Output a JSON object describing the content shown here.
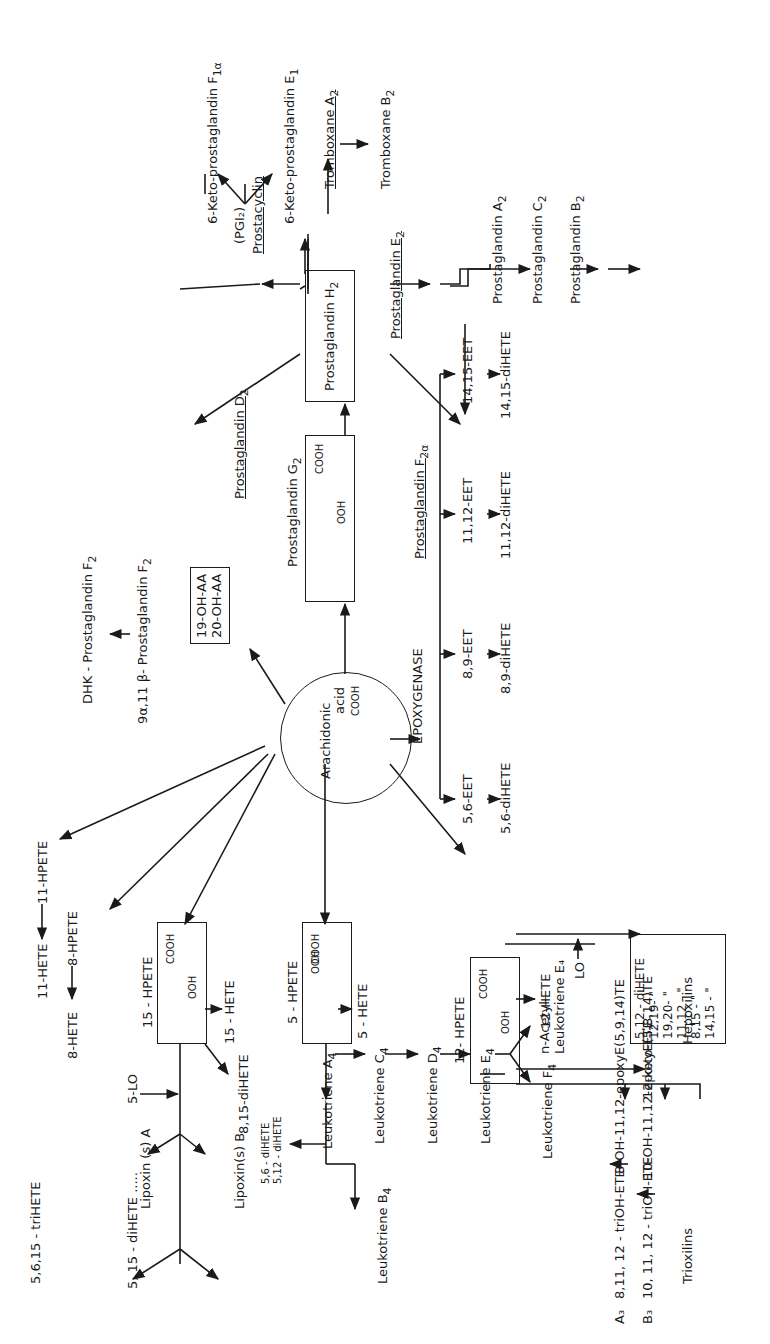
{
  "diagram": {
    "orientation": "rotated -90deg (text reads bottom-to-top)",
    "center": {
      "label_1": "Arachidonic",
      "label_2": "acid",
      "formula": "COOH"
    },
    "cyclooxygenase": {
      "pgg2": {
        "label": "Prostaglandin G",
        "sub": "2",
        "formula_cooh": "COOH",
        "formula_ooh": "OOH"
      },
      "pgh2": {
        "label": "Prostaglandin H",
        "sub": "2"
      },
      "pgd2": {
        "label": "Prostaglandin D",
        "sub": "2"
      },
      "pgf2a": {
        "label": "Prostaglandin F",
        "sub": "2α"
      },
      "pge2": {
        "label": "Prostaglandin E",
        "sub": "2"
      },
      "pgi2": {
        "label": "Prostacyclin",
        "abbr": "(PGI₂)"
      },
      "keto_f1a": {
        "label": "6-Keto-prostaglandin F",
        "sub": "1α"
      },
      "keto_e1": {
        "label": "6-Keto-prostaglandin E",
        "sub": "1"
      },
      "txa2": {
        "label": "Tromboxane A",
        "sub": "2"
      },
      "txb2": {
        "label": "Tromboxane B",
        "sub": "2"
      },
      "pga2": {
        "label": "Prostaglandin  A",
        "sub": "2"
      },
      "pgc2": {
        "label": "Prostaglandin C",
        "sub": "2"
      },
      "pgb2": {
        "label": "Prostaglandin B",
        "sub": "2"
      },
      "dhk_pgf2": {
        "label": "DHK - Prostaglandin  F",
        "sub": "2"
      },
      "pgf2_beta": {
        "label": "9α,11 β- Prostaglandin  F",
        "sub": "2"
      }
    },
    "omega_hydroxylase": {
      "line_1": "19-OH-AA",
      "line_2": "20-OH-AA"
    },
    "epoxygenase": {
      "label": "EPOXYGENASE",
      "eets": [
        "5,6-EET",
        "8,9-EET",
        "11,12-EET",
        "14,15-EET"
      ],
      "dihetes": [
        "5,6-diHETE",
        "8,9-diHETE",
        "11,12-diHETE",
        "14,15-diHETE"
      ]
    },
    "hpete_misc": {
      "hpete_11": "11-HPETE",
      "hete_11": "11-HETE",
      "hpete_8": "8-HPETE",
      "hete_8": "8-HETE"
    },
    "lipoxygenase_15": {
      "hpete": "15 - HPETE",
      "formula_cooh": "COOH",
      "formula_ooh": "OOH",
      "hete": "15 - HETE",
      "dihete": "8,15-diHETE",
      "enzyme": "5-LO",
      "lipoxin_a": "Lipoxin (s) A",
      "lipoxin_b": "Lipoxin(s) B",
      "trihete": "5,6,15 - triHETE",
      "dihete_515": "5, 15 - diHETE ....."
    },
    "lipoxygenase_5": {
      "hpete": "5 - HPETE",
      "formula_cooh": "COOH",
      "formula_ooh": "OOH",
      "hete": "5 - HETE",
      "lta4": {
        "label": "Leukotriene A",
        "sub": "4"
      },
      "ltb4": {
        "label": "Leukotriene B",
        "sub": "4"
      },
      "ltc4": {
        "label": "Leukotriene C",
        "sub": "4"
      },
      "ltd4": {
        "label": "Leukotriene D",
        "sub": "4"
      },
      "lte4": {
        "label": "Leukotriene E",
        "sub": "4"
      },
      "ltf4": {
        "label": "Leukotriene F",
        "sub": "4"
      },
      "acetyl_lte4_1": "n-Acetyl-",
      "acetyl_lte4_2": "Leukotriene E₄",
      "dihete_56": "5,6 - diHETE",
      "dihete_512": "5,12 - diHETE"
    },
    "lipoxygenase_12": {
      "hpete": "12- HPETE",
      "formula_cooh": "COOH",
      "formula_ooh": "OOH",
      "hete": "12-HETE",
      "keto": "12-keto-ETE",
      "enzyme": "LO",
      "dihete_list": [
        "5,12 - diHETE",
        "12,19-    \"",
        "19,20-    \"",
        "11,12 -   \"",
        "8,15 -    \"",
        "14,15 -   \""
      ],
      "hepoxilin_a": "8-OH-11,12-epoxyE(5,9,14)TE",
      "hepoxilin_b": "10-OH-11,12-epoxyE(5,8,14)TE",
      "hepoxilins_label": "Hepoxilins",
      "trioxilin_a_prefix": "A₃",
      "trioxilin_a": "8,11, 12 - triOH-ETE",
      "trioxilin_b_prefix": "B₃",
      "trioxilin_b": "10, 11, 12 - triOH-ETE",
      "trioxilins_label": "Trioxilins"
    }
  }
}
